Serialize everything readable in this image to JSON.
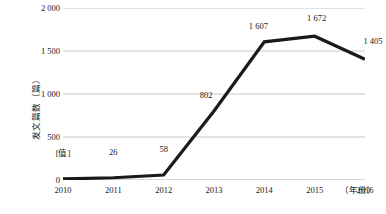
{
  "chart_data": {
    "type": "line",
    "title": "",
    "xlabel": "（年份）",
    "ylabel": "发文篇数（篇）",
    "categories": [
      "2010",
      "2011",
      "2012",
      "2013",
      "2014",
      "2015",
      "2016"
    ],
    "values": [
      12,
      26,
      58,
      802,
      1607,
      1672,
      1405
    ],
    "point_labels": [
      "[值]",
      "26",
      "58",
      "802",
      "1 607",
      "1 672",
      "1 405"
    ],
    "ylim": [
      0,
      2000
    ],
    "y_ticks": [
      0,
      500,
      1000,
      1500,
      2000
    ],
    "y_tick_labels": [
      "0",
      "500",
      "1 000",
      "1 500",
      "2 000"
    ],
    "grid": true,
    "legend": "none",
    "series": [
      {
        "name": "发文篇数",
        "values": [
          12,
          26,
          58,
          802,
          1607,
          1672,
          1405
        ],
        "color": "#1a1a1a"
      }
    ],
    "colors": {
      "line": "#1a1a1a",
      "gridline": "#c8c8c8",
      "background": "#ffffff",
      "text": "#1a1a1a"
    }
  }
}
